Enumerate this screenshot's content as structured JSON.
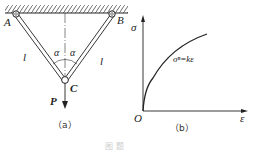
{
  "figure_a": {
    "caption": "（a）",
    "labels": {
      "A": "A",
      "B": "B",
      "C": "C",
      "P": "P",
      "l_left": "l",
      "l_right": "l",
      "alpha_left": "α",
      "alpha_right": "α"
    }
  },
  "figure_b": {
    "caption": "（b）",
    "y_axis": "σ",
    "x_axis": "ε",
    "origin": "O",
    "curve_label": "σⁿ=kε"
  },
  "footer_caption": "图 题"
}
